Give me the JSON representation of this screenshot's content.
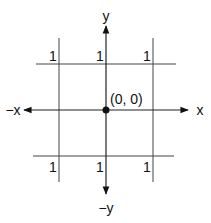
{
  "diagram": {
    "axes": {
      "x_positive_label": "x",
      "x_negative_label": "−x",
      "y_positive_label": "y",
      "y_negative_label": "−y"
    },
    "origin": {
      "label": "(0, 0)"
    },
    "grid_labels": {
      "top": [
        "1",
        "1",
        "1"
      ],
      "bottom": [
        "1",
        "1",
        "1"
      ]
    },
    "colors": {
      "line": "#333333",
      "text": "#111111",
      "background": "#ffffff"
    }
  }
}
